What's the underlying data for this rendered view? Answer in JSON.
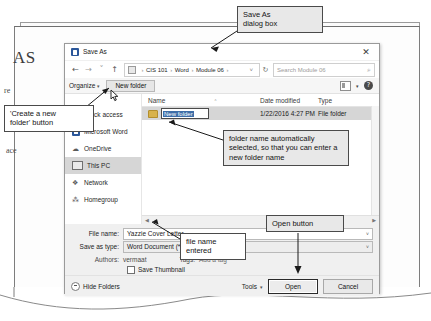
{
  "background": {
    "heading_fragment": "AS",
    "frag_left_1": "re",
    "frag_left_2": "ace",
    "footer_module": "Module 03",
    "footer_path": "...ty  ›  Word 2016  ›  01 Solution Files  ›  M...",
    "footer_path_tail": ""
  },
  "callouts": [
    {
      "name": "save-as-dialog",
      "text": "Save As\ndialog box"
    },
    {
      "name": "create-new-folder",
      "text": "'Create a new\nfolder' button"
    },
    {
      "name": "folder-name-selected",
      "text": "folder name automatically selected, so that you can enter a new folder name"
    },
    {
      "name": "file-name-entered",
      "text": "file name\nentered"
    },
    {
      "name": "open-button",
      "text": "Open button"
    }
  ],
  "callout_texts": {
    "save_as_line1": "Save As",
    "save_as_line2": "dialog box",
    "create_line1": "'Create a new",
    "create_line2": "folder' button",
    "folder_name": "folder name automatically selected, so that you can enter a new folder name",
    "file_name_line1": "file name",
    "file_name_line2": "entered",
    "open_button": "Open button"
  },
  "dialog": {
    "title": "Save As",
    "close_label": "✕",
    "nav": {
      "back": "←",
      "forward": "→",
      "recent": "˅",
      "up": "↑"
    },
    "breadcrumb": {
      "root": "",
      "items": [
        "CIS 101",
        "Word",
        "Module 06"
      ],
      "separator": "›",
      "dropdown": "˅"
    },
    "refresh_label": "↻",
    "search": {
      "placeholder": "Search Module 06",
      "icon": "⌕"
    },
    "toolbar": {
      "organize": "Organize",
      "organize_caret": "▾",
      "new_folder": "New folder",
      "view_caret": "▾",
      "help": "?"
    },
    "nav_pane": [
      {
        "label": "Quick access",
        "icon": "star-icon",
        "glyph": "★",
        "selected": false
      },
      {
        "label": "Microsoft Word",
        "icon": "word-icon",
        "glyph": "",
        "selected": false
      },
      {
        "label": "OneDrive",
        "icon": "cloud-icon",
        "glyph": "☁",
        "selected": false
      },
      {
        "label": "This PC",
        "icon": "computer-icon",
        "glyph": "",
        "selected": true
      },
      {
        "label": "Network",
        "icon": "network-icon",
        "glyph": "❖",
        "selected": false
      },
      {
        "label": "Homegroup",
        "icon": "homegroup-icon",
        "glyph": "⁂",
        "selected": false
      }
    ],
    "columns": {
      "name": "Name",
      "date_modified": "Date modified",
      "type": "Type",
      "sort_indicator": "˄"
    },
    "rows": [
      {
        "name": "New folder",
        "date_modified": "1/22/2016 4:27 PM",
        "type": "File folder",
        "editing": true
      }
    ],
    "form": {
      "file_name_label": "File name:",
      "file_name_value": "Yazzie Cover Letter",
      "save_as_type_label": "Save as type:",
      "save_as_type_value": "Word Document (*.docx)",
      "authors_label": "Authors:",
      "authors_value": "vermaat",
      "tags_label": "Tags:",
      "tags_value": "Add a tag",
      "save_thumbnail": "Save Thumbnail",
      "caret": "˅"
    },
    "footer": {
      "hide_folders": "Hide Folders",
      "tools": "Tools",
      "tools_caret": "▾",
      "open": "Open",
      "cancel": "Cancel"
    }
  },
  "colors": {
    "word_blue": "#2b579a",
    "selection_blue": "#3d6ea8",
    "row_selected": "#d6d6d6",
    "dialog_bg": "#f0f0f0",
    "callout_bg": "#e8e8e8",
    "callout_border": "#4a4a4a"
  }
}
